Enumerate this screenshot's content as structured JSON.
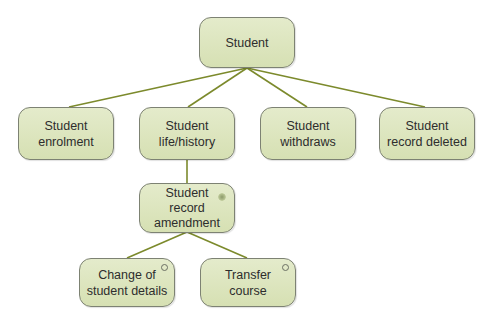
{
  "diagram": {
    "type": "hierarchy",
    "colors": {
      "node_fill": "#dde5bf",
      "node_border": "#7d8273",
      "connector": "#7c8a2c",
      "text": "#2d2d2d"
    },
    "nodes": {
      "root": {
        "label": "Student"
      },
      "enrolment": {
        "label": "Student\nenrolment"
      },
      "life_history": {
        "label": "Student\nlife/history"
      },
      "withdraws": {
        "label": "Student\nwithdraws"
      },
      "record_deleted": {
        "label": "Student\nrecord deleted"
      },
      "record_amendment": {
        "label": "Student\nrecord\namendment",
        "marker": "selection-asterisk"
      },
      "change_details": {
        "label": "Change of\nstudent details",
        "marker": "option-circle"
      },
      "transfer_course": {
        "label": "Transfer\ncourse",
        "marker": "option-circle"
      }
    },
    "edges": [
      [
        "root",
        "enrolment"
      ],
      [
        "root",
        "life_history"
      ],
      [
        "root",
        "withdraws"
      ],
      [
        "root",
        "record_deleted"
      ],
      [
        "life_history",
        "record_amendment"
      ],
      [
        "record_amendment",
        "change_details"
      ],
      [
        "record_amendment",
        "transfer_course"
      ]
    ]
  }
}
